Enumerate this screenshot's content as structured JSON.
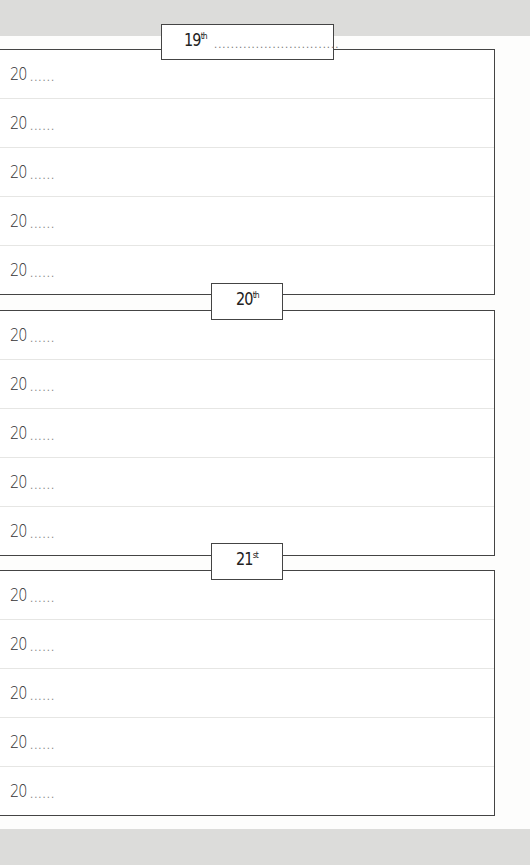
{
  "page": {
    "sections": [
      {
        "day": "19",
        "suffix": "th",
        "fill_line": "..............................",
        "rows": [
          {
            "year_prefix": "20",
            "dots": "......"
          },
          {
            "year_prefix": "20",
            "dots": "......"
          },
          {
            "year_prefix": "20",
            "dots": "......"
          },
          {
            "year_prefix": "20",
            "dots": "......"
          },
          {
            "year_prefix": "20",
            "dots": "......"
          }
        ]
      },
      {
        "day": "20",
        "suffix": "th",
        "rows": [
          {
            "year_prefix": "20",
            "dots": "......"
          },
          {
            "year_prefix": "20",
            "dots": "......"
          },
          {
            "year_prefix": "20",
            "dots": "......"
          },
          {
            "year_prefix": "20",
            "dots": "......"
          },
          {
            "year_prefix": "20",
            "dots": "......"
          }
        ]
      },
      {
        "day": "21",
        "suffix": "st",
        "rows": [
          {
            "year_prefix": "20",
            "dots": "......"
          },
          {
            "year_prefix": "20",
            "dots": "......"
          },
          {
            "year_prefix": "20",
            "dots": "......"
          },
          {
            "year_prefix": "20",
            "dots": "......"
          },
          {
            "year_prefix": "20",
            "dots": "......"
          }
        ]
      }
    ]
  }
}
